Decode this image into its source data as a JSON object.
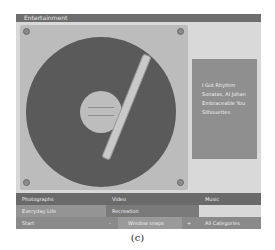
{
  "window": {
    "title": "Entertainment"
  },
  "sidebar": {
    "items": [
      {
        "label": "I Got Rhythm"
      },
      {
        "label": "Sonatas, Al Johan"
      },
      {
        "label": "Embraceable You"
      },
      {
        "label": "Silhouettes"
      }
    ]
  },
  "bottom": {
    "headers": [
      "Photographs",
      "Video",
      "Music"
    ],
    "row2": [
      "Everyday Life",
      "Recreation",
      ""
    ],
    "row3": {
      "start": "Start",
      "minus": "-",
      "field": "Window snaps",
      "plus": "+",
      "categories": "All Categories"
    }
  },
  "caption": "(c)"
}
